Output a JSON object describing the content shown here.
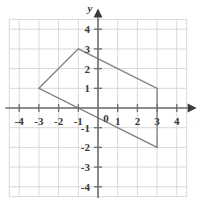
{
  "figure": {
    "name": "coordinate-plane-with-quadrilateral",
    "background_color": "#ffffff"
  },
  "chart_data": {
    "type": "scatter",
    "title": "",
    "xlabel": "x",
    "ylabel": "y",
    "xlim": [
      -4.6,
      4.6
    ],
    "ylim": [
      -4.6,
      4.6
    ],
    "grid": true,
    "grid_step": 1,
    "grid_color": "#d9d9d9",
    "axis_color": "#6e6e6e",
    "legend": "none",
    "x_ticks": [
      -4,
      -3,
      -2,
      -1,
      1,
      2,
      3,
      4
    ],
    "y_ticks": [
      4,
      3,
      2,
      1,
      -1,
      -2,
      -3,
      -4
    ],
    "x_tick_labels": [
      "-4",
      "-3",
      "-2",
      "-1",
      "1",
      "2",
      "3",
      "4"
    ],
    "y_tick_labels": [
      "4",
      "3",
      "2",
      "1",
      "-1",
      "-2",
      "-3",
      "-4"
    ],
    "origin_label": "0",
    "series": [
      {
        "name": "quadrilateral",
        "type": "polygon",
        "closed": true,
        "stroke_color": "#808080",
        "fill": "none",
        "points": [
          {
            "x": -3,
            "y": 1
          },
          {
            "x": -1,
            "y": 3
          },
          {
            "x": 3,
            "y": 1
          },
          {
            "x": 3,
            "y": -2
          }
        ],
        "vertex_labels": [
          "(-3, 1)",
          "(-1, 3)",
          "(3, 1)",
          "(3, -2)"
        ]
      }
    ]
  },
  "axis_labels": {
    "x": "x",
    "y": "y"
  }
}
